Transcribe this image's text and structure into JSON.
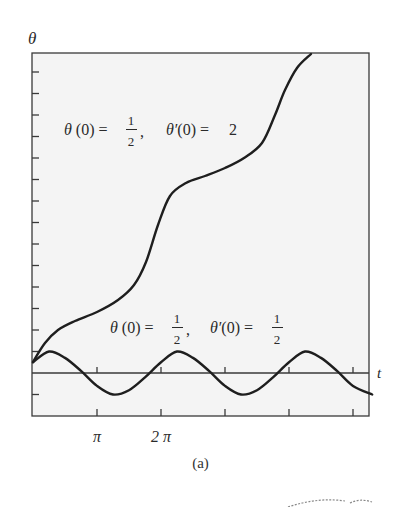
{
  "figure": {
    "caption": "(a)",
    "axes": {
      "x_label": "t",
      "y_label": "θ",
      "x_tick_labels": [
        "π",
        "2 π"
      ],
      "x_tick_positions": [
        1,
        2,
        3,
        4,
        5
      ],
      "x_tick_units": "π",
      "y_tick_step": 1
    },
    "annotations": [
      {
        "id": "upper",
        "theta0_num": "1",
        "theta0_den": "2",
        "dtheta0": "2"
      },
      {
        "id": "lower",
        "theta0_num": "1",
        "theta0_den": "2",
        "dtheta0_num": "1",
        "dtheta0_den": "2"
      }
    ],
    "colors": {
      "background": "#f4f4f4",
      "curve": "#1e1e1e",
      "axis": "#3a3a3a"
    }
  },
  "chart_data": {
    "type": "line",
    "title": "",
    "xlabel": "t",
    "ylabel": "θ",
    "xlim": [
      0,
      5.3
    ],
    "xlim_units": "π",
    "ylim": [
      -2,
      15000
    ],
    "grid": false,
    "legend": "inline annotations",
    "series": [
      {
        "name": "θ(0) = 1/2, θ'(0) = 2",
        "x_pi": [
          0,
          0.25,
          0.5,
          0.75,
          1.0,
          1.25,
          1.5,
          1.75,
          2.0,
          2.25,
          2.5,
          2.75,
          3.0,
          3.25,
          3.5,
          3.75,
          4.0,
          4.25,
          4.5,
          4.4
        ],
        "theta": [
          0.5,
          2.0,
          2.8,
          3.3,
          3.8,
          4.4,
          5.4,
          7.6,
          9.4,
          10.3,
          10.8,
          11.3,
          11.9,
          12.9,
          14.8,
          16.7,
          17.4,
          17.8,
          18.4,
          18.4
        ]
      },
      {
        "name": "θ(0) = 1/2, θ'(0) = 1/2",
        "x_pi": [
          0,
          0.25,
          0.5,
          0.75,
          1.0,
          1.25,
          1.5,
          1.75,
          2.0,
          2.25,
          2.5,
          2.75,
          3.0,
          3.25,
          3.5,
          3.75,
          4.0,
          4.25,
          4.5,
          4.75,
          5.0,
          5.3
        ],
        "theta": [
          0.5,
          1.0,
          0.7,
          0.1,
          -0.6,
          -1.0,
          -0.8,
          -0.2,
          0.5,
          1.0,
          0.7,
          0.1,
          -0.6,
          -1.0,
          -0.8,
          -0.2,
          0.5,
          1.0,
          0.7,
          0.1,
          -0.6,
          -1.0
        ]
      }
    ]
  }
}
